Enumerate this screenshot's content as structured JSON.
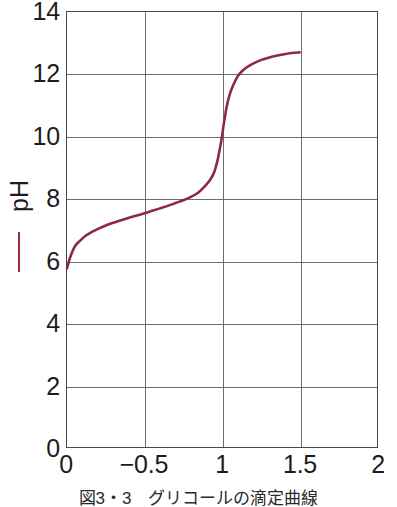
{
  "figure": {
    "caption": "図3・3　グリコールの滴定曲線",
    "background_color": "#ffffff",
    "curve_color": "#8B2B42",
    "grid_color": "#6d6d6d",
    "frame_color": "#4a4a4a",
    "text_color": "#1c1c1c"
  },
  "yaxis": {
    "title": "pH",
    "legend_marker": "red-dash",
    "legend_marker_color": "#9b2d3f",
    "ticks": [
      {
        "label": "14",
        "value": 14
      },
      {
        "label": "12",
        "value": 12
      },
      {
        "label": "10",
        "value": 10
      },
      {
        "label": "8",
        "value": 8
      },
      {
        "label": "6",
        "value": 6
      },
      {
        "label": "4",
        "value": 4
      },
      {
        "label": "2",
        "value": 2
      },
      {
        "label": "0",
        "value": 0
      }
    ]
  },
  "xaxis": {
    "ticks": [
      {
        "label": "0",
        "value": 0
      },
      {
        "label": "−0.5",
        "value": 0.5
      },
      {
        "label": "1",
        "value": 1
      },
      {
        "label": "1.5",
        "value": 1.5
      },
      {
        "label": "2",
        "value": 2
      }
    ]
  },
  "chart_data": {
    "type": "line",
    "title": "",
    "subtitle": "",
    "xlabel": "",
    "ylabel": "pH",
    "xlim": [
      0,
      2
    ],
    "ylim": [
      0,
      14
    ],
    "grid": true,
    "legend": false,
    "x_ticks": [
      0,
      0.5,
      1,
      1.5,
      2
    ],
    "x_tick_labels": [
      "0",
      "−0.5",
      "1",
      "1.5",
      "2"
    ],
    "y_ticks": [
      0,
      2,
      4,
      6,
      8,
      10,
      12,
      14
    ],
    "y_tick_labels": [
      "0",
      "2",
      "4",
      "6",
      "8",
      "10",
      "12",
      "14"
    ],
    "series": [
      {
        "name": "titration-curve",
        "color": "#8B2B42",
        "x": [
          0.0,
          0.02,
          0.05,
          0.08,
          0.12,
          0.16,
          0.2,
          0.25,
          0.3,
          0.35,
          0.4,
          0.45,
          0.5,
          0.55,
          0.6,
          0.65,
          0.7,
          0.75,
          0.8,
          0.85,
          0.9,
          0.93,
          0.95,
          0.97,
          0.98,
          0.99,
          1.0,
          1.01,
          1.02,
          1.03,
          1.05,
          1.07,
          1.1,
          1.13,
          1.16,
          1.2,
          1.25,
          1.3,
          1.35,
          1.4,
          1.45,
          1.5
        ],
        "y": [
          5.75,
          6.1,
          6.45,
          6.62,
          6.8,
          6.92,
          7.02,
          7.13,
          7.22,
          7.3,
          7.38,
          7.45,
          7.52,
          7.6,
          7.68,
          7.76,
          7.85,
          7.94,
          8.05,
          8.2,
          8.45,
          8.65,
          8.85,
          9.2,
          9.45,
          9.7,
          10.0,
          10.35,
          10.65,
          10.95,
          11.35,
          11.62,
          11.92,
          12.1,
          12.22,
          12.34,
          12.45,
          12.53,
          12.59,
          12.64,
          12.68,
          12.7
        ]
      }
    ],
    "annotations": [
      {
        "text": "equivalence point",
        "x": 1.0,
        "y": 10.0
      },
      {
        "text": "curve start",
        "x": 0.0,
        "y": 5.75
      },
      {
        "text": "curve end",
        "x": 1.5,
        "y": 12.7
      }
    ]
  }
}
